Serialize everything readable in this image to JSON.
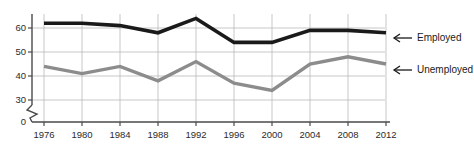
{
  "chart_data": {
    "type": "line",
    "title": "",
    "subtitle": "",
    "xlabel": "",
    "ylabel": "",
    "categories": [
      "1976",
      "1980",
      "1984",
      "1988",
      "1992",
      "1996",
      "2000",
      "2004",
      "2008",
      "2012"
    ],
    "x": [
      1976,
      1980,
      1984,
      1988,
      1992,
      1996,
      2000,
      2004,
      2008,
      2012
    ],
    "series": [
      {
        "name": "Employed",
        "color": "#1a1a1a",
        "values": [
          62,
          62,
          61,
          58,
          64,
          54,
          54,
          59,
          59,
          58
        ]
      },
      {
        "name": "Unemployed",
        "color": "#8c8c8c",
        "values": [
          44,
          41,
          44,
          38,
          46,
          37,
          34,
          45,
          48,
          45
        ]
      }
    ],
    "ylim": [
      30,
      66
    ],
    "yticks": [
      30,
      40,
      50,
      60
    ],
    "ytick_labels": [
      "30",
      "40",
      "50",
      "60"
    ],
    "y_origin_label": "0",
    "axis_break": true,
    "grid": true,
    "legend_position": "right-inline",
    "annotations": [
      {
        "text": "Employed",
        "arrow": "left",
        "series": "Employed"
      },
      {
        "text": "Unemployed",
        "arrow": "left",
        "series": "Unemployed"
      }
    ]
  },
  "axis": {
    "y_labels": [
      "60",
      "50",
      "40",
      "30",
      "0"
    ],
    "x_labels": [
      "1976",
      "1980",
      "1984",
      "1988",
      "1992",
      "1996",
      "2000",
      "2004",
      "2008",
      "2012"
    ]
  },
  "legend": {
    "employed_label": "Employed",
    "unemployed_label": "Unemployed"
  },
  "colors": {
    "employed": "#1a1a1a",
    "unemployed": "#8c8c8c",
    "grid": "#b9b9b9",
    "axis": "#4a4a4a",
    "text": "#2b2b2b",
    "background": "#ffffff"
  }
}
